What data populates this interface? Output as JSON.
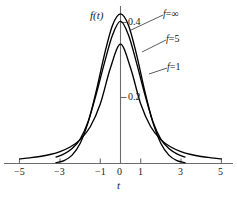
{
  "chart_data": {
    "type": "line",
    "title": "",
    "subtitle": "",
    "xlabel": "t",
    "ylabel": "f(t)",
    "xlim": [
      -5.6,
      5.6
    ],
    "ylim": [
      0,
      0.46
    ],
    "grid": false,
    "legend_position": "inline-annotations",
    "x_ticks": [
      -5,
      -3,
      -1,
      0,
      1,
      3,
      5
    ],
    "x_tick_labels": [
      "−5",
      "−3",
      "−1",
      "0",
      "1",
      "3",
      "5"
    ],
    "y_ticks": [
      0.2,
      0.4
    ],
    "y_tick_labels": [
      "0.2",
      "0.4"
    ],
    "series": [
      {
        "name": "f=1",
        "label": "f=1",
        "peak": 0.318,
        "x": [
          -5.0,
          -4.5,
          -4.0,
          -3.5,
          -3.0,
          -2.5,
          -2.0,
          -1.5,
          -1.0,
          -0.5,
          0.0,
          0.5,
          1.0,
          1.5,
          2.0,
          2.5,
          3.0,
          3.5,
          4.0,
          4.5,
          5.0
        ],
        "values": [
          0.0122,
          0.0151,
          0.0187,
          0.024,
          0.0318,
          0.0439,
          0.0637,
          0.0979,
          0.1592,
          0.2546,
          0.3183,
          0.2546,
          0.1592,
          0.0979,
          0.0637,
          0.0439,
          0.0318,
          0.024,
          0.0187,
          0.0151,
          0.0122
        ]
      },
      {
        "name": "f=5",
        "label": "f=5",
        "peak": 0.3796,
        "x": [
          -3.2,
          -2.8,
          -2.4,
          -2.0,
          -1.6,
          -1.2,
          -0.8,
          -0.4,
          0.0,
          0.4,
          0.8,
          1.2,
          1.6,
          2.0,
          2.4,
          2.8,
          3.2
        ],
        "values": [
          0.0171,
          0.0256,
          0.0397,
          0.0651,
          0.1128,
          0.1861,
          0.2676,
          0.3421,
          0.3796,
          0.3421,
          0.2676,
          0.1861,
          0.1128,
          0.0651,
          0.0397,
          0.0256,
          0.0171
        ]
      },
      {
        "name": "f=infinity",
        "label": "f=∞",
        "peak": 0.3989,
        "x": [
          -3.2,
          -2.8,
          -2.4,
          -2.0,
          -1.6,
          -1.2,
          -0.8,
          -0.4,
          0.0,
          0.4,
          0.8,
          1.2,
          1.6,
          2.0,
          2.4,
          2.8,
          3.2
        ],
        "values": [
          0.0024,
          0.0079,
          0.0224,
          0.054,
          0.1109,
          0.1942,
          0.2897,
          0.3683,
          0.3989,
          0.3683,
          0.2897,
          0.1942,
          0.1109,
          0.054,
          0.0224,
          0.0079,
          0.0024
        ]
      }
    ],
    "annotations": [
      {
        "text": "f=∞",
        "for": "f=infinity"
      },
      {
        "text": "f=5",
        "for": "f=5"
      },
      {
        "text": "f=1",
        "for": "f=1"
      }
    ],
    "colors": {
      "curve": "#000000",
      "axis": "#5a5a5a",
      "text": "#1a1a1a",
      "background": "#ffffff"
    }
  },
  "axes": {
    "y_axis_title": "f(t)",
    "x_axis_title": "t",
    "y_tick_0_4": "0.4",
    "y_tick_0_2": "0.2"
  },
  "x_tick_labels": {
    "n5": "−5",
    "n3": "−3",
    "n1": "−1",
    "z0": "0",
    "p1": "1",
    "p3": "3",
    "p5": "5"
  },
  "curve_labels": {
    "inf_f": "f",
    "inf_eq": "=∞",
    "five_f": "f",
    "five_eq": "=5",
    "one_f": "f",
    "one_eq": "=1"
  }
}
